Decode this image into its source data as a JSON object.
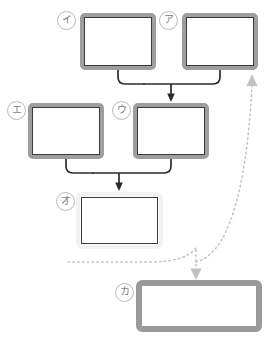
{
  "diagram": {
    "type": "flowchart",
    "canvas": {
      "width": 269,
      "height": 340,
      "background": "#ffffff"
    },
    "palette": {
      "frame_gray": "#9e9e9e",
      "inner_dark": "#3a3a3a",
      "pale_frame": "#f2f2f2",
      "tag_outline": "#b9b9b9",
      "tag_text": "#7d7d7d",
      "solid_connector": "#2b2b2b",
      "dotted_connector": "#bdbdbd"
    },
    "nodes": [
      {
        "id": "i",
        "label": "イ",
        "style": "framed",
        "x": 80,
        "y": 13,
        "w": 76,
        "h": 57
      },
      {
        "id": "a",
        "label": "ア",
        "style": "framed",
        "x": 182,
        "y": 13,
        "w": 76,
        "h": 57
      },
      {
        "id": "e",
        "label": "エ",
        "style": "framed",
        "x": 28,
        "y": 103,
        "w": 76,
        "h": 56
      },
      {
        "id": "u",
        "label": "ウ",
        "style": "framed",
        "x": 133,
        "y": 103,
        "w": 76,
        "h": 56
      },
      {
        "id": "o",
        "label": "オ",
        "style": "pale",
        "x": 76,
        "y": 192,
        "w": 87,
        "h": 57
      },
      {
        "id": "ka",
        "label": "カ",
        "style": "plain",
        "x": 136,
        "y": 280,
        "w": 126,
        "h": 52
      }
    ],
    "tags": [
      {
        "for": "i",
        "text": "イ",
        "x": 57,
        "y": 11
      },
      {
        "for": "a",
        "text": "ア",
        "x": 159,
        "y": 11
      },
      {
        "for": "e",
        "text": "エ",
        "x": 7,
        "y": 101
      },
      {
        "for": "u",
        "text": "ウ",
        "x": 112,
        "y": 101
      },
      {
        "for": "o",
        "text": "オ",
        "x": 56,
        "y": 192
      },
      {
        "for": "ka",
        "text": "カ",
        "x": 115,
        "y": 283
      }
    ],
    "connectors": [
      {
        "id": "merge-top",
        "kind": "solid",
        "from": [
          "i",
          "a"
        ],
        "to": "u",
        "arrow": "down"
      },
      {
        "id": "merge-middle",
        "kind": "solid",
        "from": [
          "e",
          "u"
        ],
        "to": "o",
        "arrow": "down"
      },
      {
        "id": "feedback-to-ka",
        "kind": "dotted",
        "from": "o",
        "to": "ka",
        "arrow": "down"
      },
      {
        "id": "feedback-to-a",
        "kind": "dotted",
        "from": "ka",
        "to": "a",
        "arrow": "up"
      }
    ]
  }
}
